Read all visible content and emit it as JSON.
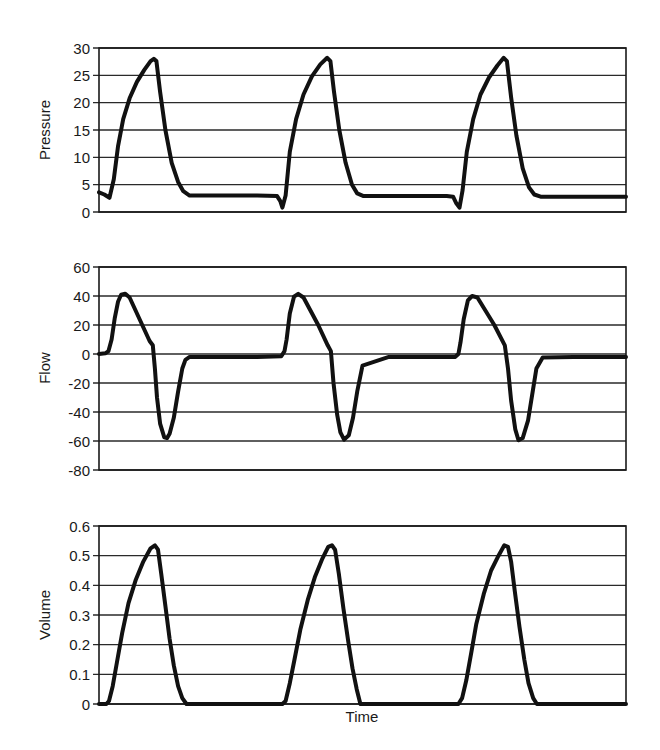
{
  "chart_data": [
    {
      "type": "line",
      "title": "",
      "xlabel": "",
      "ylabel": "Pressure",
      "ylim": [
        0,
        30
      ],
      "yticks": [
        0,
        5,
        10,
        15,
        20,
        25,
        30
      ],
      "grid": true,
      "x_units": "normalized time (0-100)",
      "series": [
        {
          "name": "Pressure",
          "x": [
            0,
            1,
            2,
            2.8,
            3.6,
            4.6,
            5.8,
            7.2,
            8.6,
            9.8,
            10.4,
            10.9,
            11.6,
            12.6,
            13.8,
            15.0,
            16.0,
            17.2,
            20,
            30,
            33.8,
            34.4,
            34.8,
            35.4,
            36.2,
            37.4,
            38.8,
            40.4,
            42.0,
            43.3,
            43.9,
            44.6,
            45.6,
            46.8,
            48.0,
            49.0,
            50.2,
            55,
            66,
            67.2,
            67.8,
            68.4,
            69.0,
            69.8,
            71.0,
            72.4,
            74.0,
            75.6,
            76.8,
            77.4,
            78.2,
            79.2,
            80.4,
            81.6,
            82.6,
            83.8,
            90,
            100
          ],
          "y": [
            3.6,
            3.2,
            2.6,
            6.0,
            12.0,
            17.0,
            20.8,
            23.8,
            26.0,
            27.6,
            28.0,
            27.6,
            22.0,
            15.0,
            9.0,
            5.5,
            3.8,
            3.0,
            3.0,
            3.0,
            2.9,
            2.0,
            0.8,
            3.0,
            11.0,
            17.0,
            21.5,
            24.8,
            27.0,
            28.2,
            27.6,
            22.0,
            15.0,
            9.0,
            5.0,
            3.4,
            2.9,
            2.9,
            2.9,
            2.8,
            1.6,
            0.8,
            4.0,
            11.0,
            17.0,
            21.5,
            24.6,
            26.8,
            28.2,
            27.6,
            21.0,
            14.0,
            8.0,
            4.5,
            3.2,
            2.8,
            2.8,
            2.8
          ]
        }
      ]
    },
    {
      "type": "line",
      "title": "",
      "xlabel": "",
      "ylabel": "Flow",
      "ylim": [
        -80,
        60
      ],
      "yticks": [
        -80,
        -60,
        -40,
        -20,
        0,
        20,
        40,
        60
      ],
      "grid": true,
      "x_units": "normalized time (0-100)",
      "series": [
        {
          "name": "Flow",
          "x": [
            0,
            1.2,
            1.8,
            2.4,
            3.0,
            3.6,
            4.2,
            5.0,
            5.8,
            9.6,
            10.2,
            10.6,
            11.0,
            11.6,
            12.4,
            12.9,
            13.4,
            14.2,
            15.0,
            15.8,
            16.4,
            17.2,
            20,
            30,
            34.6,
            35.2,
            35.6,
            36.2,
            37.0,
            37.8,
            38.8,
            41.6,
            43.4,
            44.0,
            44.5,
            45.2,
            45.8,
            46.5,
            47.4,
            48.2,
            49.0,
            50.0,
            55,
            66,
            67.6,
            68.2,
            68.6,
            69.2,
            70.0,
            70.8,
            71.8,
            75.0,
            77.0,
            77.6,
            78.2,
            79.0,
            79.6,
            80.4,
            81.4,
            82.2,
            83.0,
            84.2,
            90,
            100
          ],
          "y": [
            0,
            0.5,
            2,
            10,
            25,
            36,
            40.8,
            41.5,
            39,
            9,
            6,
            -10,
            -30,
            -48,
            -57.5,
            -58,
            -55,
            -44,
            -26,
            -10,
            -4,
            -2,
            -2,
            -2,
            -1.5,
            2,
            10,
            28,
            39.5,
            41.5,
            39,
            20,
            6,
            2,
            -20,
            -42,
            -54,
            -59,
            -56,
            -44,
            -26,
            -8,
            -2,
            -2,
            -2,
            0,
            8,
            24,
            37,
            40,
            39,
            20,
            6,
            -10,
            -32,
            -52,
            -59.5,
            -58,
            -46,
            -28,
            -10,
            -2.5,
            -2,
            -2
          ]
        }
      ]
    },
    {
      "type": "line",
      "title": "",
      "xlabel": "Time",
      "ylabel": "Volume",
      "ylim": [
        0,
        0.6
      ],
      "yticks": [
        0,
        0.1,
        0.2,
        0.3,
        0.4,
        0.5,
        0.6
      ],
      "grid": true,
      "x_units": "normalized time (0-100)",
      "series": [
        {
          "name": "Volume",
          "x": [
            0,
            1.4,
            1.9,
            2.6,
            3.4,
            4.4,
            5.6,
            7.0,
            8.4,
            9.8,
            10.6,
            11.2,
            11.8,
            12.6,
            13.4,
            14.2,
            15.0,
            15.8,
            16.6,
            20,
            30,
            34.8,
            35.4,
            36.2,
            37.1,
            38.2,
            39.6,
            41.0,
            42.4,
            43.5,
            44.2,
            44.8,
            45.5,
            46.4,
            47.3,
            48.1,
            48.9,
            49.6,
            55,
            67,
            68.2,
            68.9,
            69.7,
            70.6,
            71.6,
            73.0,
            74.4,
            75.8,
            76.9,
            77.6,
            78.2,
            78.9,
            79.8,
            80.7,
            81.5,
            82.4,
            83.1,
            90,
            100
          ],
          "y": [
            0,
            0,
            0.01,
            0.06,
            0.14,
            0.24,
            0.34,
            0.42,
            0.48,
            0.525,
            0.535,
            0.52,
            0.44,
            0.33,
            0.22,
            0.13,
            0.06,
            0.02,
            0,
            0,
            0,
            0,
            0.01,
            0.07,
            0.15,
            0.25,
            0.35,
            0.43,
            0.49,
            0.53,
            0.535,
            0.52,
            0.44,
            0.32,
            0.21,
            0.12,
            0.05,
            0,
            0,
            0,
            0,
            0.02,
            0.08,
            0.17,
            0.27,
            0.37,
            0.45,
            0.5,
            0.535,
            0.53,
            0.48,
            0.38,
            0.26,
            0.15,
            0.07,
            0.02,
            0,
            0,
            0
          ]
        }
      ]
    }
  ],
  "labels": {
    "pressure_axis": "Pressure",
    "flow_axis": "Flow",
    "volume_axis": "Volume",
    "time_axis": "Time"
  },
  "colors": {
    "trace": "#111111",
    "grid": "#2a2a2a",
    "background": "#ffffff"
  }
}
